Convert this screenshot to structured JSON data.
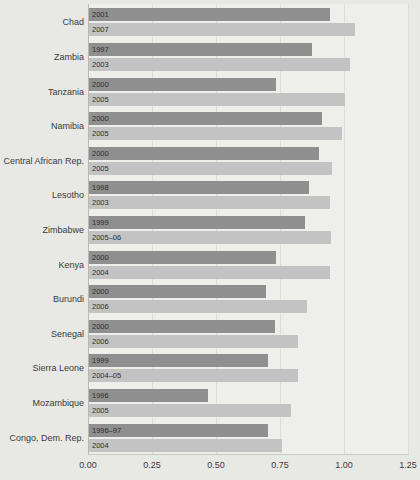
{
  "chart_data": {
    "type": "bar",
    "orientation": "horizontal",
    "title": "",
    "subtitle": "",
    "xlabel": "",
    "ylabel": "",
    "xlim": [
      0.0,
      1.3125
    ],
    "xticks": [
      "0.00",
      "0.25",
      "0.50",
      "0.75",
      "1.00",
      "1.25"
    ],
    "xtick_values": [
      0.0,
      0.25,
      0.5,
      0.75,
      1.0,
      1.25
    ],
    "grid": true,
    "legend": "none",
    "legend_position": "none",
    "colors": {
      "earlier_survey": "#8f8f8f",
      "later_survey": "#c3c3c3",
      "plot_background": "#eeeeea",
      "figure_background": "#e8e8e4",
      "gridline": "#dcdcd8",
      "text": "#3b3b3b"
    },
    "categories": [
      "Chad",
      "Zambia",
      "Tanzania",
      "Namibia",
      "Central African Rep.",
      "Lesotho",
      "Zimbabwe",
      "Kenya",
      "Burundi",
      "Senegal",
      "Sierra Leone",
      "Mozambique",
      "Congo, Dem. Rep."
    ],
    "groups": [
      {
        "country": "Chad",
        "bars": [
          {
            "year": "2001",
            "value": 0.94,
            "series": "earlier_survey"
          },
          {
            "year": "2007",
            "value": 1.04,
            "series": "later_survey"
          }
        ]
      },
      {
        "country": "Zambia",
        "bars": [
          {
            "year": "1997",
            "value": 0.87,
            "series": "earlier_survey"
          },
          {
            "year": "2003",
            "value": 1.02,
            "series": "later_survey"
          }
        ]
      },
      {
        "country": "Tanzania",
        "bars": [
          {
            "year": "2000",
            "value": 0.73,
            "series": "earlier_survey"
          },
          {
            "year": "2005",
            "value": 1.0,
            "series": "later_survey"
          }
        ]
      },
      {
        "country": "Namibia",
        "bars": [
          {
            "year": "2000",
            "value": 0.91,
            "series": "earlier_survey"
          },
          {
            "year": "2005",
            "value": 0.99,
            "series": "later_survey"
          }
        ]
      },
      {
        "country": "Central African Rep.",
        "bars": [
          {
            "year": "2000",
            "value": 0.9,
            "series": "earlier_survey"
          },
          {
            "year": "2005",
            "value": 0.95,
            "series": "later_survey"
          }
        ]
      },
      {
        "country": "Lesotho",
        "bars": [
          {
            "year": "1998",
            "value": 0.86,
            "series": "earlier_survey"
          },
          {
            "year": "2003",
            "value": 0.94,
            "series": "later_survey"
          }
        ]
      },
      {
        "country": "Zimbabwe",
        "bars": [
          {
            "year": "1999",
            "value": 0.845,
            "series": "earlier_survey"
          },
          {
            "year": "2005–06",
            "value": 0.945,
            "series": "later_survey"
          }
        ]
      },
      {
        "country": "Kenya",
        "bars": [
          {
            "year": "2000",
            "value": 0.73,
            "series": "earlier_survey"
          },
          {
            "year": "2004",
            "value": 0.94,
            "series": "later_survey"
          }
        ]
      },
      {
        "country": "Burundi",
        "bars": [
          {
            "year": "2000",
            "value": 0.69,
            "series": "earlier_survey"
          },
          {
            "year": "2006",
            "value": 0.85,
            "series": "later_survey"
          }
        ]
      },
      {
        "country": "Senegal",
        "bars": [
          {
            "year": "2000",
            "value": 0.725,
            "series": "earlier_survey"
          },
          {
            "year": "2006",
            "value": 0.815,
            "series": "later_survey"
          }
        ]
      },
      {
        "country": "Sierra Leone",
        "bars": [
          {
            "year": "1999",
            "value": 0.7,
            "series": "earlier_survey"
          },
          {
            "year": "2004–05",
            "value": 0.815,
            "series": "later_survey"
          }
        ]
      },
      {
        "country": "Mozambique",
        "bars": [
          {
            "year": "1996",
            "value": 0.465,
            "series": "earlier_survey"
          },
          {
            "year": "2005",
            "value": 0.79,
            "series": "later_survey"
          }
        ]
      },
      {
        "country": "Congo, Dem. Rep.",
        "bars": [
          {
            "year": "1996–97",
            "value": 0.7,
            "series": "earlier_survey"
          },
          {
            "year": "2004",
            "value": 0.755,
            "series": "later_survey"
          }
        ]
      }
    ]
  }
}
